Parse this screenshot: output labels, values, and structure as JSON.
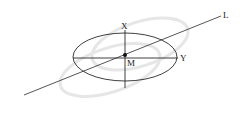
{
  "diagram": {
    "labels": {
      "x_axis": "X",
      "y_axis": "Y",
      "center": "M",
      "line": "L"
    },
    "colors": {
      "stroke": "#2a2a2a",
      "shadow": "#d8d8d8",
      "background": "#ffffff"
    }
  }
}
